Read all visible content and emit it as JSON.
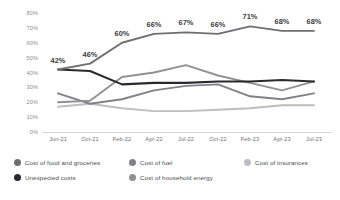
{
  "chart_data": {
    "type": "line",
    "title": "",
    "xlabel": "",
    "ylabel": "",
    "ylim": [
      0,
      80
    ],
    "ytick_labels": [
      "80%",
      "70%",
      "60%",
      "50%",
      "40%",
      "30%",
      "20%",
      "10%",
      "0%"
    ],
    "ytick_values": [
      80,
      70,
      60,
      50,
      40,
      30,
      20,
      10,
      0
    ],
    "grid": false,
    "legend_position": "bottom",
    "categories": [
      "Jun-21",
      "Oct-21",
      "Feb-22",
      "Apr-22",
      "Jul-22",
      "Oct-22",
      "Feb-23",
      "Apr-23",
      "Jul-23"
    ],
    "series": [
      {
        "name": "Cost of food and groceries",
        "color": "#6e6e73",
        "values": [
          42,
          46,
          60,
          66,
          67,
          66,
          71,
          68,
          68
        ],
        "labels": [
          "42%",
          "46%",
          "60%",
          "66%",
          "67%",
          "66%",
          "71%",
          "68%",
          "68%"
        ],
        "labelled": true
      },
      {
        "name": "Unexpected costs",
        "color": "#2a2a2e",
        "values": [
          42,
          41,
          32,
          33,
          33,
          34,
          34,
          35,
          34
        ],
        "labelled": false
      },
      {
        "name": "Cost of household energy",
        "color": "#919196",
        "values": [
          20,
          21,
          37,
          40,
          45,
          38,
          33,
          28,
          34
        ],
        "labelled": false
      },
      {
        "name": "Cost of fuel",
        "color": "#81818a",
        "values": [
          26,
          19,
          22,
          28,
          31,
          32,
          24,
          22,
          26
        ],
        "labelled": false
      },
      {
        "name": "Cost of insurances",
        "color": "#bdbdc2",
        "values": [
          17,
          19,
          16,
          14,
          14,
          15,
          16,
          18,
          18
        ],
        "labelled": false
      }
    ]
  },
  "legend": {
    "items": [
      {
        "label": "Cost of food and groceries",
        "color": "#6e6e73"
      },
      {
        "label": "Cost of fuel",
        "color": "#81818a"
      },
      {
        "label": "Cost of insurances",
        "color": "#bdbdc2"
      },
      {
        "label": "Unexpected costs",
        "color": "#2a2a2e"
      },
      {
        "label": "Cost of household energy",
        "color": "#919196"
      }
    ]
  }
}
